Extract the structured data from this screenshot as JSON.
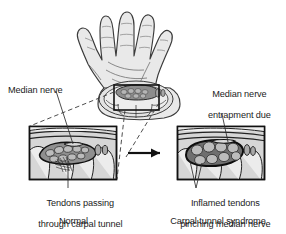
{
  "figure": {
    "background_color": "#ffffff",
    "line_color": "#1c1c1c",
    "text_color": "#1c1c1c",
    "skin_fill": "#e9e9e9",
    "tunnel_fill": "#8d8d8d",
    "tendon_fill": "#b8b8b8",
    "nerve_fill": "#6a6a6a",
    "inset_fill": "#d6d6d6"
  },
  "labels": {
    "median_nerve": "Median nerve",
    "entrapment_line1": "Median nerve",
    "entrapment_line2": "entrapment due",
    "entrapment_line3": "to edema",
    "tendons_line1": "Tendons passing",
    "tendons_line2": "through carpal tunnel",
    "inflamed_line1": "Inflamed tendons",
    "inflamed_line2": "pinching median nerve",
    "caption_left": "Normal",
    "caption_right": "Carpal tunnel syndrome"
  },
  "panels": [
    {
      "id": "normal",
      "caption": "Normal",
      "callout_label": "Tendons passing through carpal tunnel",
      "pointer_label": "Median nerve",
      "box": {
        "x": 29,
        "y": 126,
        "width": 88,
        "height": 54
      }
    },
    {
      "id": "carpal-tunnel-syndrome",
      "caption": "Carpal tunnel syndrome",
      "callout_label": "Inflamed tendons pinching median nerve",
      "pointer_label": "Median nerve entrapment due to edema",
      "box": {
        "x": 177,
        "y": 126,
        "width": 88,
        "height": 54
      }
    }
  ],
  "icons": {
    "hand": "hand-palm-illustration",
    "arrow": "right-arrow-icon",
    "zoom_box": "zoom-region-box",
    "leader_dashed": "dashed-leader-line",
    "leader_solid": "solid-leader-line"
  }
}
